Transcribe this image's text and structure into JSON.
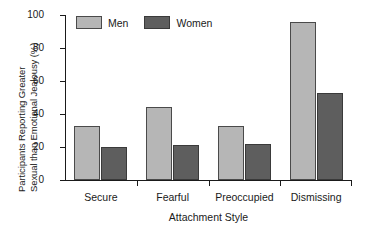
{
  "chart_data": {
    "type": "bar",
    "title": "",
    "subtitle": "",
    "categories": [
      "Secure",
      "Fearful",
      "Preoccupied",
      "Dismissing"
    ],
    "series": [
      {
        "name": "Men",
        "values": [
          33,
          44,
          33,
          96
        ],
        "color": "#b6b6b6"
      },
      {
        "name": "Women",
        "values": [
          20,
          21,
          22,
          53
        ],
        "color": "#5e5e5e"
      }
    ],
    "xlabel": "Attachment Style",
    "ylabel": "Participants Reporting Greater Sexual than Emotional Jealousy (%)",
    "ylabel_line1": "Participants Reporting Greater",
    "ylabel_line2": "Sexual than Emotional Jealousy (%)",
    "ylim": [
      0,
      100
    ],
    "yticks": [
      0,
      20,
      40,
      60,
      80,
      100
    ],
    "ytick_labels": [
      "0",
      "20",
      "40",
      "60",
      "80",
      "100"
    ],
    "grid": false,
    "legend_position": "top-left",
    "legend_entries": [
      "Men",
      "Women"
    ]
  },
  "legend": {
    "men_label": "Men",
    "women_label": "Women"
  },
  "axes": {
    "x_title": "Attachment Style"
  }
}
